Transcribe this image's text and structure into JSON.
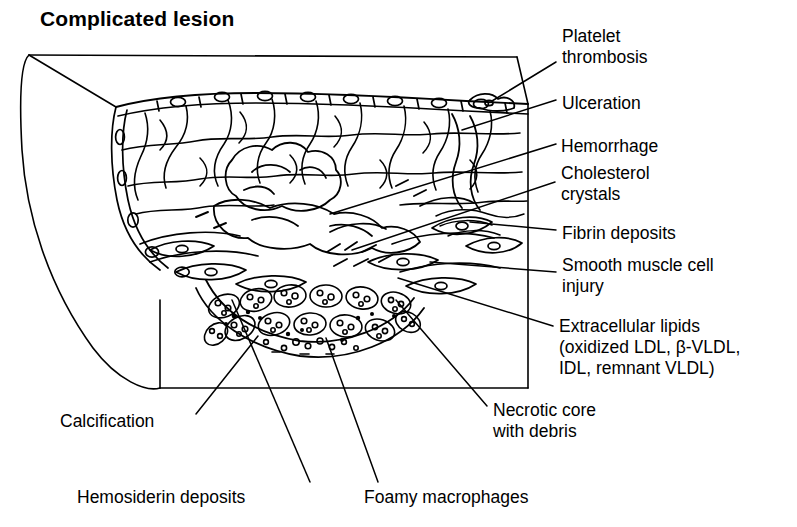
{
  "figure": {
    "title": "Complicated lesion",
    "ink_color": "#000000",
    "background_color": "#ffffff"
  },
  "callouts": {
    "platelet_thrombosis": "Platelet\nthrombosis",
    "ulceration": "Ulceration",
    "hemorrhage": "Hemorrhage",
    "cholesterol_crystals": "Cholesterol\ncrystals",
    "fibrin_deposits": "Fibrin deposits",
    "smooth_muscle_cell_injury": "Smooth muscle cell\ninjury",
    "extracellular_lipids": "Extracellular lipids\n(oxidized LDL, β-VLDL,\nIDL, remnant VLDL)",
    "calcification": "Calcification",
    "necrotic_core": "Necrotic core\nwith debris",
    "hemosiderin_deposits": "Hemosiderin deposits",
    "foamy_macrophages": "Foamy macrophages"
  }
}
